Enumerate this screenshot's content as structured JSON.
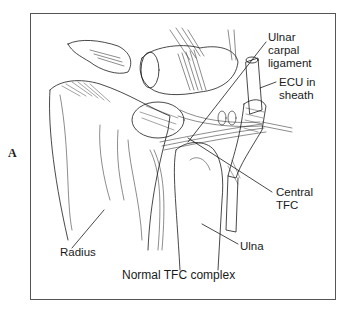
{
  "figure": {
    "panel_letter": "A",
    "caption": "Normal TFC complex",
    "labels": {
      "ulnar_carpal_ligament": [
        "Ulnar",
        "carpal",
        "ligament"
      ],
      "ecu_in_sheath": [
        "ECU in",
        "sheath"
      ],
      "central_tfc": [
        "Central",
        "TFC"
      ],
      "ulna": "Ulna",
      "radius": "Radius"
    },
    "colors": {
      "ink": "#1a1a1a",
      "frame": "#555555",
      "background": "#ffffff"
    }
  }
}
